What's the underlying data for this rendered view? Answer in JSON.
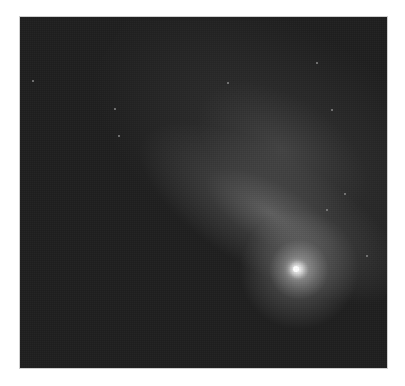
{
  "image": {
    "subject": "Comet with bright nucleus and diffuse tail against dark star field",
    "alt": "Grayscale astronomical photograph of a comet",
    "colors": {
      "background": "#1e1e1e",
      "nucleus": "#ffffff",
      "tail": "#6e6e6e",
      "stars": "#8a8a8a",
      "page": "#ffffff"
    },
    "nucleus_position": {
      "x": 300,
      "y": 272
    },
    "frame": {
      "left": 20,
      "top": 17,
      "right": 387,
      "bottom": 368
    }
  },
  "stars": [
    {
      "x": 207,
      "y": 65
    },
    {
      "x": 98,
      "y": 118
    },
    {
      "x": 296,
      "y": 45
    },
    {
      "x": 311,
      "y": 92
    },
    {
      "x": 306,
      "y": 192
    },
    {
      "x": 324,
      "y": 176
    },
    {
      "x": 94,
      "y": 91
    },
    {
      "x": 346,
      "y": 238
    },
    {
      "x": 12,
      "y": 63
    }
  ]
}
